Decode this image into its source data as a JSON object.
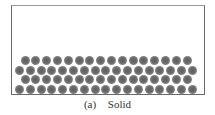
{
  "figure": {
    "caption_label": "(a)",
    "caption_text": "Solid"
  },
  "diagram": {
    "container": "rectangular box",
    "particle_color": "#6c6c6c",
    "rows": [
      {
        "row": 1,
        "count": 16,
        "offset": "indented"
      },
      {
        "row": 2,
        "count": 17,
        "offset": "flush"
      },
      {
        "row": 3,
        "count": 16,
        "offset": "indented"
      },
      {
        "row": 4,
        "count": 17,
        "offset": "flush"
      }
    ]
  }
}
